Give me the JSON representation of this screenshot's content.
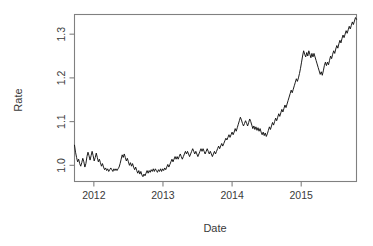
{
  "figure": {
    "background_color": "#ffffff",
    "frame_color": "#808080",
    "line_color": "#111111",
    "width": 373,
    "height": 246
  },
  "axes": {
    "x_title": "Date",
    "y_title": "Rate",
    "x_ticklabels": [
      "2012",
      "2013",
      "2014",
      "2015"
    ],
    "y_ticklabels": [
      "1.0",
      "1.1",
      "1.2",
      "1.3"
    ]
  },
  "chart_data": {
    "type": "line",
    "title": "",
    "subtitle": "",
    "xlabel": "Date",
    "ylabel": "Rate",
    "legend": [],
    "legend_position": "none",
    "grid": false,
    "xlim": [
      2011.72,
      2015.8
    ],
    "ylim": [
      0.963,
      1.345
    ],
    "xticks": [
      2012,
      2013,
      2014,
      2015
    ],
    "xticklabels": [
      "2012",
      "2013",
      "2014",
      "2015"
    ],
    "yticks": [
      1.0,
      1.1,
      1.2,
      1.3
    ],
    "yticklabels": [
      "1.0",
      "1.1",
      "1.2",
      "1.3"
    ],
    "series": [
      {
        "name": "Rate",
        "color": "#111111",
        "x": [
          2011.72,
          2011.735,
          2011.75,
          2011.765,
          2011.78,
          2011.795,
          2011.81,
          2011.825,
          2011.84,
          2011.855,
          2011.87,
          2011.885,
          2011.9,
          2011.915,
          2011.93,
          2011.945,
          2011.96,
          2011.975,
          2011.99,
          2012.005,
          2012.02,
          2012.035,
          2012.05,
          2012.065,
          2012.08,
          2012.095,
          2012.11,
          2012.125,
          2012.14,
          2012.155,
          2012.17,
          2012.185,
          2012.2,
          2012.215,
          2012.23,
          2012.245,
          2012.26,
          2012.275,
          2012.29,
          2012.305,
          2012.32,
          2012.335,
          2012.35,
          2012.365,
          2012.38,
          2012.395,
          2012.41,
          2012.425,
          2012.44,
          2012.455,
          2012.47,
          2012.485,
          2012.5,
          2012.515,
          2012.53,
          2012.545,
          2012.56,
          2012.575,
          2012.59,
          2012.605,
          2012.62,
          2012.635,
          2012.65,
          2012.665,
          2012.68,
          2012.695,
          2012.71,
          2012.725,
          2012.74,
          2012.755,
          2012.77,
          2012.785,
          2012.8,
          2012.815,
          2012.83,
          2012.845,
          2012.86,
          2012.875,
          2012.89,
          2012.905,
          2012.92,
          2012.935,
          2012.95,
          2012.965,
          2012.98,
          2012.995,
          2013.01,
          2013.025,
          2013.04,
          2013.055,
          2013.07,
          2013.085,
          2013.1,
          2013.115,
          2013.13,
          2013.145,
          2013.16,
          2013.175,
          2013.19,
          2013.205,
          2013.22,
          2013.235,
          2013.25,
          2013.265,
          2013.28,
          2013.295,
          2013.31,
          2013.325,
          2013.34,
          2013.355,
          2013.37,
          2013.385,
          2013.4,
          2013.415,
          2013.43,
          2013.445,
          2013.46,
          2013.475,
          2013.49,
          2013.505,
          2013.52,
          2013.535,
          2013.55,
          2013.565,
          2013.58,
          2013.595,
          2013.61,
          2013.625,
          2013.64,
          2013.655,
          2013.67,
          2013.685,
          2013.7,
          2013.715,
          2013.73,
          2013.745,
          2013.76,
          2013.775,
          2013.79,
          2013.805,
          2013.82,
          2013.835,
          2013.85,
          2013.865,
          2013.88,
          2013.895,
          2013.91,
          2013.925,
          2013.94,
          2013.955,
          2013.97,
          2013.985,
          2014.0,
          2014.015,
          2014.03,
          2014.045,
          2014.06,
          2014.075,
          2014.09,
          2014.105,
          2014.12,
          2014.135,
          2014.15,
          2014.165,
          2014.18,
          2014.195,
          2014.21,
          2014.225,
          2014.24,
          2014.255,
          2014.27,
          2014.285,
          2014.3,
          2014.315,
          2014.33,
          2014.345,
          2014.36,
          2014.375,
          2014.39,
          2014.405,
          2014.42,
          2014.435,
          2014.45,
          2014.465,
          2014.48,
          2014.495,
          2014.51,
          2014.525,
          2014.54,
          2014.555,
          2014.57,
          2014.585,
          2014.6,
          2014.615,
          2014.63,
          2014.645,
          2014.66,
          2014.675,
          2014.69,
          2014.705,
          2014.72,
          2014.735,
          2014.75,
          2014.765,
          2014.78,
          2014.795,
          2014.81,
          2014.825,
          2014.84,
          2014.855,
          2014.87,
          2014.885,
          2014.9,
          2014.915,
          2014.93,
          2014.945,
          2014.96,
          2014.975,
          2014.99,
          2015.005,
          2015.02,
          2015.035,
          2015.05,
          2015.065,
          2015.08,
          2015.095,
          2015.11,
          2015.125,
          2015.14,
          2015.155,
          2015.17,
          2015.185,
          2015.2,
          2015.215,
          2015.23,
          2015.245,
          2015.26,
          2015.275,
          2015.29,
          2015.305,
          2015.32,
          2015.335,
          2015.35,
          2015.365,
          2015.38,
          2015.395,
          2015.41,
          2015.425,
          2015.44,
          2015.455,
          2015.47,
          2015.485,
          2015.5,
          2015.515,
          2015.53,
          2015.545,
          2015.56,
          2015.575,
          2015.59,
          2015.605,
          2015.62,
          2015.635,
          2015.65,
          2015.665,
          2015.68,
          2015.695,
          2015.71,
          2015.725,
          2015.74,
          2015.755,
          2015.77,
          2015.785,
          2015.8
        ],
        "y": [
          1.046,
          1.03,
          1.018,
          1.008,
          1.014,
          1.004,
          0.998,
          1.006,
          1.016,
          1.008,
          0.996,
          1.004,
          1.02,
          1.03,
          1.022,
          1.012,
          1.022,
          1.032,
          1.022,
          1.01,
          1.018,
          1.028,
          1.018,
          1.008,
          1.014,
          1.006,
          0.998,
          1.004,
          0.996,
          0.99,
          0.994,
          0.988,
          0.992,
          0.986,
          0.99,
          0.994,
          0.99,
          0.986,
          0.992,
          0.988,
          0.992,
          0.988,
          0.992,
          0.996,
          1.004,
          1.014,
          1.024,
          1.018,
          1.026,
          1.018,
          1.01,
          1.016,
          1.008,
          1.0,
          1.006,
          0.998,
          1.004,
          0.996,
          0.99,
          0.996,
          0.988,
          0.982,
          0.988,
          0.98,
          0.986,
          0.978,
          0.974,
          0.98,
          0.976,
          0.982,
          0.988,
          0.982,
          0.988,
          0.984,
          0.99,
          0.986,
          0.992,
          0.986,
          0.992,
          0.988,
          0.984,
          0.99,
          0.986,
          0.992,
          0.986,
          0.992,
          0.988,
          0.994,
          0.99,
          0.996,
          1.002,
          0.996,
          1.002,
          1.008,
          1.014,
          1.008,
          1.014,
          1.02,
          1.014,
          1.02,
          1.014,
          1.02,
          1.026,
          1.02,
          1.014,
          1.02,
          1.026,
          1.032,
          1.026,
          1.032,
          1.026,
          1.02,
          1.026,
          1.032,
          1.038,
          1.032,
          1.026,
          1.032,
          1.026,
          1.02,
          1.026,
          1.032,
          1.038,
          1.032,
          1.038,
          1.032,
          1.026,
          1.032,
          1.038,
          1.032,
          1.026,
          1.032,
          1.026,
          1.02,
          1.026,
          1.032,
          1.026,
          1.032,
          1.038,
          1.044,
          1.038,
          1.044,
          1.05,
          1.044,
          1.05,
          1.056,
          1.062,
          1.058,
          1.064,
          1.07,
          1.064,
          1.07,
          1.076,
          1.07,
          1.076,
          1.084,
          1.078,
          1.086,
          1.094,
          1.102,
          1.11,
          1.104,
          1.096,
          1.09,
          1.096,
          1.102,
          1.096,
          1.09,
          1.098,
          1.106,
          1.1,
          1.092,
          1.084,
          1.09,
          1.082,
          1.088,
          1.08,
          1.086,
          1.078,
          1.084,
          1.076,
          1.07,
          1.076,
          1.068,
          1.074,
          1.066,
          1.072,
          1.08,
          1.088,
          1.082,
          1.09,
          1.098,
          1.092,
          1.1,
          1.108,
          1.102,
          1.11,
          1.118,
          1.112,
          1.12,
          1.128,
          1.122,
          1.13,
          1.138,
          1.132,
          1.14,
          1.148,
          1.156,
          1.164,
          1.172,
          1.166,
          1.174,
          1.182,
          1.19,
          1.198,
          1.192,
          1.2,
          1.21,
          1.222,
          1.236,
          1.25,
          1.262,
          1.254,
          1.248,
          1.258,
          1.25,
          1.262,
          1.254,
          1.246,
          1.256,
          1.248,
          1.256,
          1.248,
          1.24,
          1.232,
          1.224,
          1.216,
          1.208,
          1.214,
          1.206,
          1.216,
          1.228,
          1.236,
          1.228,
          1.236,
          1.23,
          1.24,
          1.25,
          1.244,
          1.254,
          1.262,
          1.256,
          1.266,
          1.274,
          1.268,
          1.278,
          1.286,
          1.28,
          1.29,
          1.298,
          1.292,
          1.3,
          1.308,
          1.302,
          1.31,
          1.318,
          1.312,
          1.32,
          1.328,
          1.322,
          1.33,
          1.338,
          1.334
        ]
      }
    ]
  }
}
